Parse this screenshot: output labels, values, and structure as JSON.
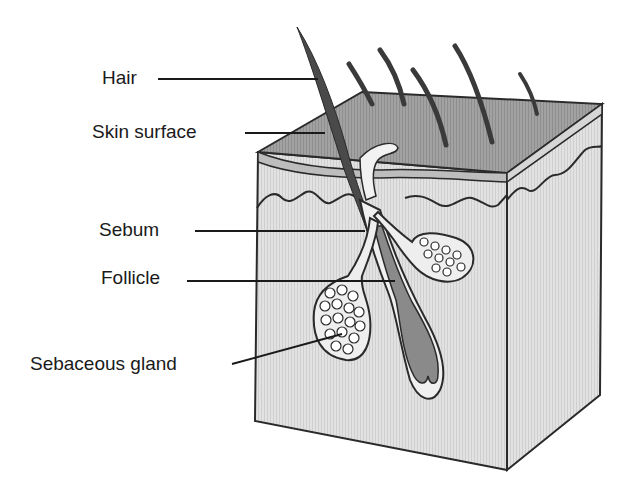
{
  "labels": {
    "hair": "Hair",
    "skin_surface": "Skin surface",
    "sebum": "Sebum",
    "follicle": "Follicle",
    "sebaceous_gland": "Sebaceous gland"
  },
  "colors": {
    "outline": "#2a2a2a",
    "surface_fill": "#9a9a9a",
    "dermis_fill": "#dcdcdc",
    "side_fill": "#e4e4e4",
    "hair_fill": "#5a5a5a",
    "follicle_fill": "#8c8c8c",
    "gland_fill": "#d0d0d0",
    "background": "#ffffff"
  }
}
